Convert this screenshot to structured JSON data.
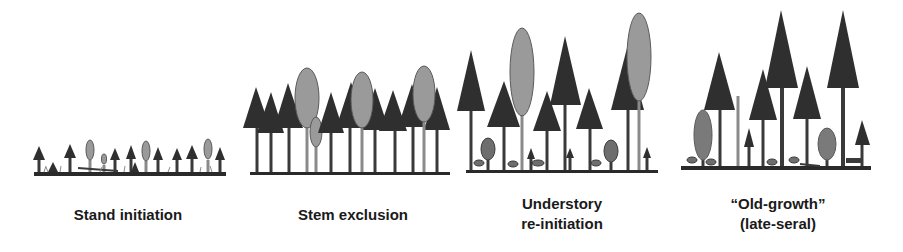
{
  "colors": {
    "conifer": "#2f2f2f",
    "broadleaf": "#9a9a9a",
    "broadleaf_outline": "#5a5a5a",
    "understory_shrub": "#6e6e6e",
    "ground": "#2a2a2a",
    "background": "#ffffff"
  },
  "stages": [
    {
      "id": "stand-initiation",
      "label_lines": [
        "Stand initiation"
      ]
    },
    {
      "id": "stem-exclusion",
      "label_lines": [
        "Stem exclusion"
      ]
    },
    {
      "id": "understory-reinitiation",
      "label_lines": [
        "Understory",
        "re-initiation"
      ]
    },
    {
      "id": "old-growth",
      "label_lines": [
        "“Old-growth”",
        "(late-seral)"
      ]
    }
  ],
  "legend_semantics": {
    "dark-triangle": "conifer tree",
    "gray-oval": "broadleaf tree",
    "small-dark-oval": "understory shrub"
  }
}
